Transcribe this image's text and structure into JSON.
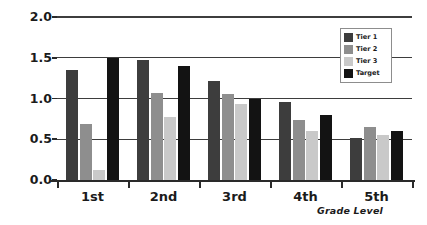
{
  "chart_data": {
    "type": "bar",
    "title": "",
    "xlabel": "Grade Level",
    "ylabel": "Rate of Improvement (words correct/week)",
    "categories": [
      "1st",
      "2nd",
      "3rd",
      "4th",
      "5th"
    ],
    "series": [
      {
        "name": "Tier 1",
        "color": "#3d3d3d",
        "values": [
          1.35,
          1.47,
          1.22,
          0.96,
          0.51
        ]
      },
      {
        "name": "Tier 2",
        "color": "#8e8e8e",
        "values": [
          0.69,
          1.07,
          1.05,
          0.74,
          0.65
        ]
      },
      {
        "name": "Tier 3",
        "color": "#c9c9c9",
        "values": [
          0.12,
          0.77,
          0.93,
          0.6,
          0.55
        ]
      },
      {
        "name": "Target",
        "color": "#131313",
        "values": [
          1.5,
          1.4,
          1.0,
          0.8,
          0.6
        ]
      }
    ],
    "ylim": [
      0.0,
      2.0
    ],
    "yticks": [
      0.0,
      0.5,
      1.0,
      1.5,
      2.0
    ],
    "ytick_labels": [
      "0.0",
      "0.5",
      "1.0",
      "1.5",
      "2.0"
    ],
    "grid": true,
    "grid_axis": "y",
    "legend_position": "upper-right",
    "legend_entries": [
      "Tier 1",
      "Tier 2",
      "Tier 3",
      "Target"
    ]
  }
}
